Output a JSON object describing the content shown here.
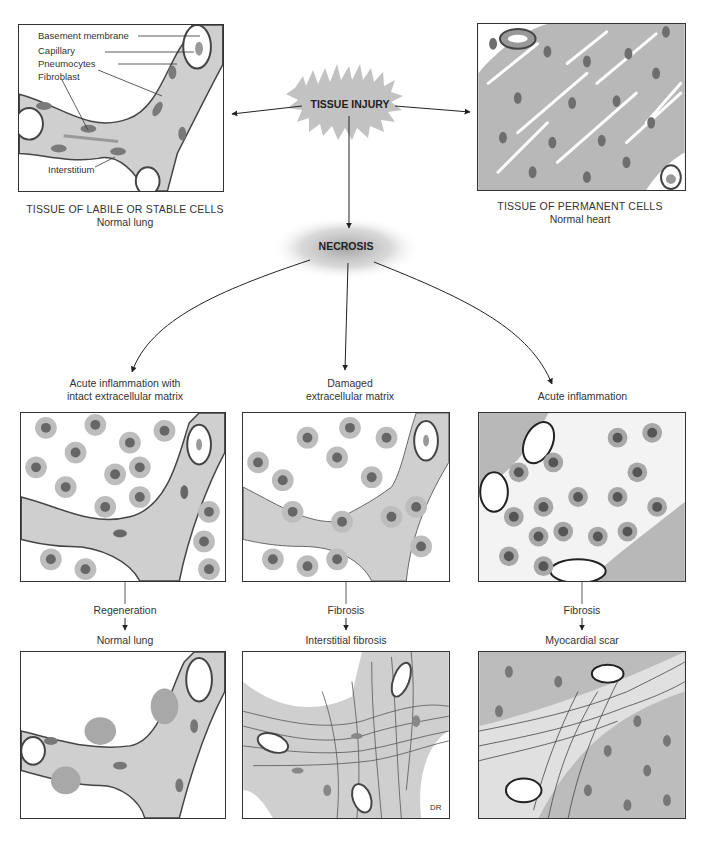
{
  "header": {
    "partial_top_text": "...atraumatic repair, regeneration..."
  },
  "top": {
    "left_panel": {
      "caption_line1": "TISSUE OF LABILE OR STABLE CELLS",
      "caption_line2": "Normal lung",
      "labels": {
        "basement_membrane": "Basement membrane",
        "capillary": "Capillary",
        "pneumocytes": "Pneumocytes",
        "fibroblast": "Fibroblast",
        "interstitium": "Interstitium"
      }
    },
    "center": {
      "injury_label": "TISSUE INJURY",
      "necrosis_label": "NECROSIS"
    },
    "right_panel": {
      "caption_line1": "TISSUE OF PERMANENT CELLS",
      "caption_line2": "Normal heart"
    }
  },
  "middle": {
    "columns": [
      {
        "title_line1": "Acute inflammation with",
        "title_line2": "intact extracellular matrix",
        "process": "Regeneration",
        "outcome": "Normal lung"
      },
      {
        "title_line1": "Damaged",
        "title_line2": "extracellular matrix",
        "process": "Fibrosis",
        "outcome": "Interstitial fibrosis"
      },
      {
        "title_line1": "",
        "title_line2": "Acute inflammation",
        "process": "Fibrosis",
        "outcome": "Myocardial scar"
      }
    ]
  },
  "colors": {
    "tissue_gray": "#c8c8c8",
    "nucleus_gray": "#6e6e6e",
    "muscle_gray": "#b0b0b0",
    "line_dark": "#333333",
    "burst_gray": "#bdbdbd"
  },
  "signature": "DR"
}
